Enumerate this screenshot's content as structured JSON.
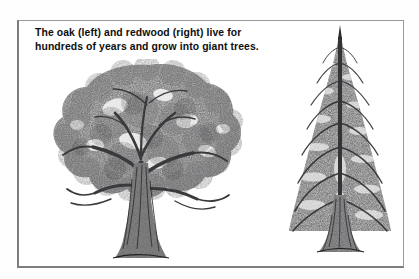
{
  "page": {
    "top_partial_text": "· · · · · · · · · · · ·",
    "background_color": "#ffffff"
  },
  "figure": {
    "border_color": "#9a9a9c",
    "caption": {
      "line1": "The oak (left) and redwood (right) live for",
      "line2": "hundreds of years and grow into giant trees.",
      "color": "#0e0e0e"
    },
    "illustrations": [
      {
        "name": "oak-tree",
        "position": "left",
        "common_name": "oak",
        "form": "broad spreading deciduous crown with thick ridged trunk",
        "style": "black-and-white engraving",
        "ink_color": "#5d5d5f"
      },
      {
        "name": "redwood-tree",
        "position": "right",
        "common_name": "redwood",
        "form": "tall narrow conical conifer with drooping tiered branches",
        "style": "black-and-white engraving",
        "ink_color": "#5d5d5f"
      }
    ]
  }
}
